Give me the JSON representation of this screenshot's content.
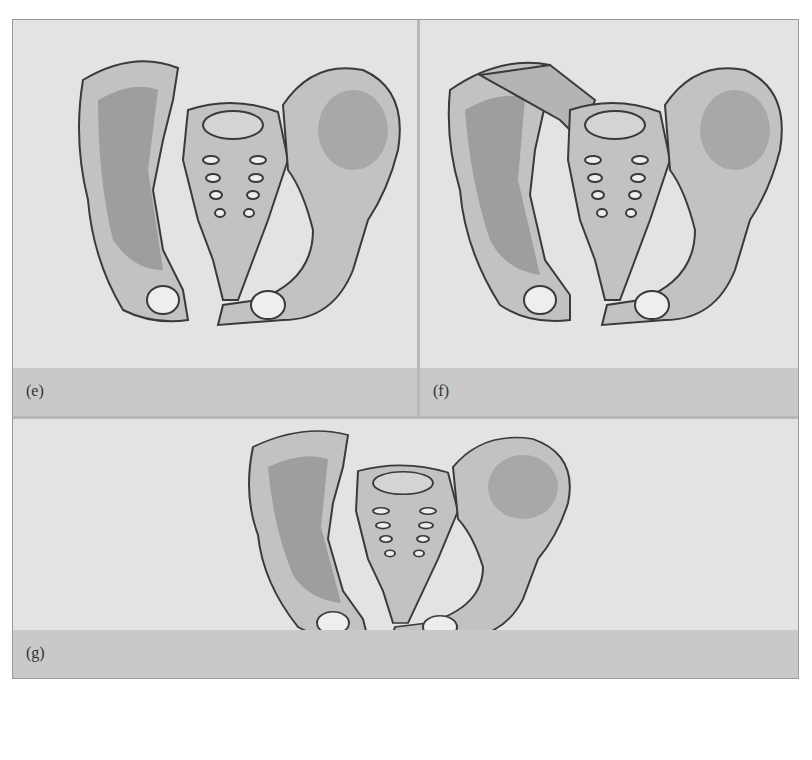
{
  "figure": {
    "panels": [
      {
        "id": "e",
        "label": "(e)",
        "description": "Pelvis with fracture through left sacroiliac region and pubic symphysis disruption"
      },
      {
        "id": "f",
        "label": "(f)",
        "description": "Pelvis with fracture through left ilium and sacrum, separated pubic symphysis"
      },
      {
        "id": "g",
        "label": "(g)",
        "description": "Pelvis with fracture through sacrum and pubic rami"
      }
    ],
    "colors": {
      "background": "#e3e3e3",
      "caption_bar": "#c9c9c9",
      "bone_light": "#c2c2c2",
      "bone_dark": "#9e9e9e",
      "outline": "#3a3a3a",
      "divider": "#ffffff"
    }
  }
}
